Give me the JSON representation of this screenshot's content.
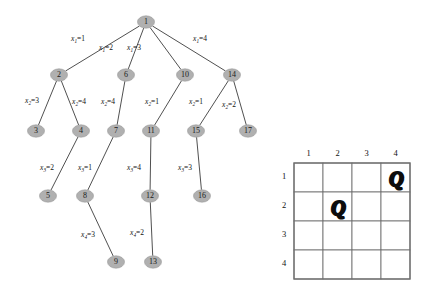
{
  "figure": {
    "node_fill": "#b0b0b0",
    "node_stroke": "#9a9a9a",
    "edge_color": "#3c3c3c",
    "grid_color": "#6e6e6e",
    "queen_color": "#0d0d0d"
  },
  "tree": {
    "nodes": [
      {
        "id": "n1",
        "label": "1",
        "x": 146,
        "y": 22
      },
      {
        "id": "n2",
        "label": "2",
        "x": 59,
        "y": 75
      },
      {
        "id": "n6",
        "label": "6",
        "x": 126,
        "y": 75
      },
      {
        "id": "n10",
        "label": "10",
        "x": 185,
        "y": 75
      },
      {
        "id": "n14",
        "label": "14",
        "x": 232,
        "y": 75
      },
      {
        "id": "n3",
        "label": "3",
        "x": 36,
        "y": 131
      },
      {
        "id": "n4",
        "label": "4",
        "x": 81,
        "y": 131
      },
      {
        "id": "n7",
        "label": "7",
        "x": 116,
        "y": 131
      },
      {
        "id": "n11",
        "label": "11",
        "x": 151,
        "y": 131
      },
      {
        "id": "n15",
        "label": "15",
        "x": 196,
        "y": 131
      },
      {
        "id": "n17",
        "label": "17",
        "x": 248,
        "y": 131
      },
      {
        "id": "n5",
        "label": "5",
        "x": 48,
        "y": 196
      },
      {
        "id": "n8",
        "label": "8",
        "x": 85,
        "y": 196
      },
      {
        "id": "n12",
        "label": "12",
        "x": 150,
        "y": 196
      },
      {
        "id": "n16",
        "label": "16",
        "x": 202,
        "y": 196
      },
      {
        "id": "n9",
        "label": "9",
        "x": 116,
        "y": 262
      },
      {
        "id": "n13",
        "label": "13",
        "x": 153,
        "y": 262
      }
    ],
    "edges": [
      {
        "from": "n1",
        "to": "n2"
      },
      {
        "from": "n1",
        "to": "n6"
      },
      {
        "from": "n1",
        "to": "n10"
      },
      {
        "from": "n1",
        "to": "n14"
      },
      {
        "from": "n2",
        "to": "n3"
      },
      {
        "from": "n2",
        "to": "n4"
      },
      {
        "from": "n6",
        "to": "n7"
      },
      {
        "from": "n10",
        "to": "n11"
      },
      {
        "from": "n14",
        "to": "n15"
      },
      {
        "from": "n14",
        "to": "n17"
      },
      {
        "from": "n4",
        "to": "n5"
      },
      {
        "from": "n7",
        "to": "n8"
      },
      {
        "from": "n11",
        "to": "n12"
      },
      {
        "from": "n15",
        "to": "n16"
      },
      {
        "from": "n8",
        "to": "n9"
      },
      {
        "from": "n12",
        "to": "n13"
      }
    ],
    "edge_labels": [
      {
        "id": "e1",
        "var": "x",
        "sub": "1",
        "value": "1",
        "x": 78,
        "y": 41
      },
      {
        "id": "e2",
        "var": "x",
        "sub": "1",
        "value": "2",
        "x": 106,
        "y": 50
      },
      {
        "id": "e3",
        "var": "x",
        "sub": "1",
        "value": "3",
        "x": 134,
        "y": 50
      },
      {
        "id": "e4",
        "var": "x",
        "sub": "1",
        "value": "4",
        "x": 200,
        "y": 41
      },
      {
        "id": "e5",
        "var": "x",
        "sub": "2",
        "value": "3",
        "x": 32,
        "y": 103
      },
      {
        "id": "e6",
        "var": "x",
        "sub": "2",
        "value": "4",
        "x": 79,
        "y": 104
      },
      {
        "id": "e7",
        "var": "x",
        "sub": "2",
        "value": "4",
        "x": 108,
        "y": 104
      },
      {
        "id": "e8",
        "var": "x",
        "sub": "2",
        "value": "1",
        "x": 152,
        "y": 104
      },
      {
        "id": "e9",
        "var": "x",
        "sub": "2",
        "value": "1",
        "x": 196,
        "y": 104
      },
      {
        "id": "e10",
        "var": "x",
        "sub": "2",
        "value": "2",
        "x": 229,
        "y": 107
      },
      {
        "id": "e11",
        "var": "x",
        "sub": "3",
        "value": "2",
        "x": 47,
        "y": 170
      },
      {
        "id": "e12",
        "var": "x",
        "sub": "3",
        "value": "1",
        "x": 85,
        "y": 170
      },
      {
        "id": "e13",
        "var": "x",
        "sub": "3",
        "value": "4",
        "x": 134,
        "y": 170
      },
      {
        "id": "e14",
        "var": "x",
        "sub": "3",
        "value": "3",
        "x": 185,
        "y": 170
      },
      {
        "id": "e15",
        "var": "x",
        "sub": "4",
        "value": "3",
        "x": 88,
        "y": 237
      },
      {
        "id": "e16",
        "var": "x",
        "sub": "4",
        "value": "2",
        "x": 137,
        "y": 235
      }
    ]
  },
  "chessboard": {
    "origin_x": 294,
    "origin_y": 163,
    "cell": 29,
    "size": 4,
    "column_headers": [
      "1",
      "2",
      "3",
      "4"
    ],
    "row_headers": [
      "1",
      "2",
      "3",
      "4"
    ],
    "queen_glyph": "Q",
    "queens": [
      {
        "row": 1,
        "col": 4
      },
      {
        "row": 2,
        "col": 2
      }
    ]
  }
}
